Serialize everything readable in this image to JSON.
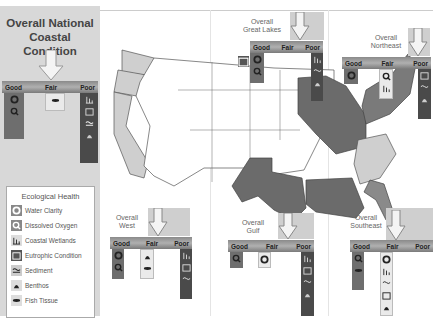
{
  "national": {
    "title_line1": "Overall National",
    "title_line2": "Coastal Condition",
    "overall_rating": "Fair",
    "scale": {
      "good": "Good",
      "fair": "Fair",
      "poor": "Poor"
    },
    "good": [
      "water-clarity",
      "dissolved-oxygen"
    ],
    "fair": [
      "fish-tissue"
    ],
    "poor": [
      "coastal-wetlands",
      "eutrophic-condition",
      "sediment",
      "benthos"
    ]
  },
  "legend": {
    "title": "Ecological Health",
    "items": [
      {
        "icon": "water-clarity-icon",
        "label": "Water Clarity"
      },
      {
        "icon": "dissolved-oxygen-icon",
        "label": "Dissolved Oxygen"
      },
      {
        "icon": "coastal-wetlands-icon",
        "label": "Coastal Wetlands"
      },
      {
        "icon": "eutrophic-condition-icon",
        "label": "Eutrophic Condition"
      },
      {
        "icon": "sediment-icon",
        "label": "Sediment"
      },
      {
        "icon": "benthos-icon",
        "label": "Benthos"
      },
      {
        "icon": "fish-tissue-icon",
        "label": "Fish Tissue"
      }
    ]
  },
  "regions": {
    "great_lakes": {
      "line1": "Overall",
      "line2": "Great Lakes",
      "overall_rating": "Poor",
      "scale": {
        "good": "Good",
        "fair": "Fair",
        "poor": "Poor"
      }
    },
    "northeast": {
      "line1": "Overall",
      "line2": "Northeast",
      "overall_rating": "Poor",
      "scale": {
        "good": "Good",
        "fair": "Fair",
        "poor": "Poor"
      }
    },
    "west": {
      "line1": "Overall",
      "line2": "West",
      "overall_rating": "Fair",
      "scale": {
        "good": "Good",
        "fair": "Fair",
        "poor": "Poor"
      }
    },
    "gulf": {
      "line1": "Overall",
      "line2": "Gulf",
      "overall_rating": "Poor",
      "scale": {
        "good": "Good",
        "fair": "Fair",
        "poor": "Poor"
      }
    },
    "southeast": {
      "line1": "Overall",
      "line2": "Southeast",
      "overall_rating": "Fair",
      "scale": {
        "good": "Good",
        "fair": "Fair",
        "poor": "Poor"
      }
    }
  },
  "colors": {
    "good": "#6e6e6e",
    "fair": "#c8c8c8",
    "poor": "#5a5a5a",
    "unassessed": "#ffffff",
    "sidebar": "#d8d8d8"
  }
}
